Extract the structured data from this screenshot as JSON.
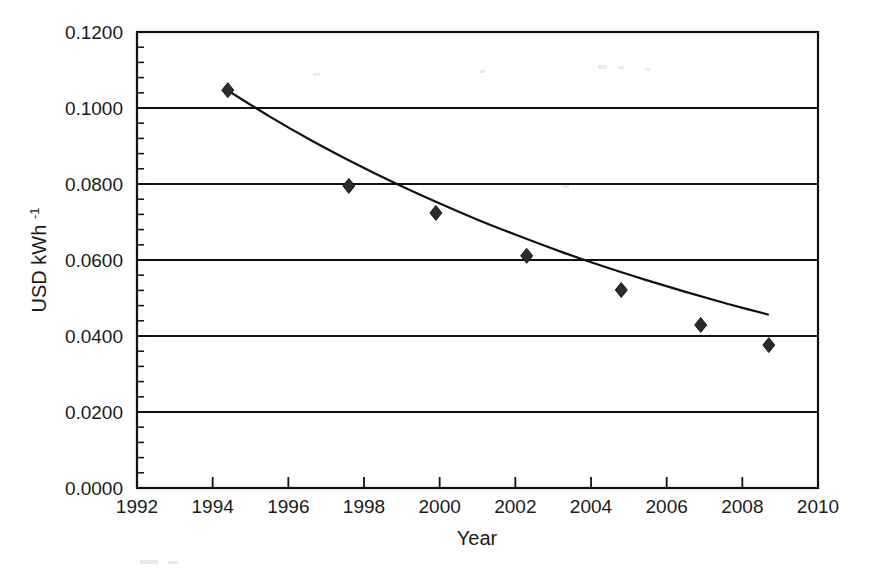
{
  "chart_data": {
    "type": "scatter",
    "title": "",
    "subtitle": "",
    "xlabel": "Year",
    "ylabel": "USD kWh",
    "ylabel_superscript": "-1",
    "ylabel_full": "USD kWh⁻¹",
    "xlim": [
      1992,
      2010
    ],
    "ylim": [
      0.0,
      0.12
    ],
    "grid": "horizontal-major-only",
    "legend": "none",
    "x_ticks": [
      1992,
      1994,
      1996,
      1998,
      2000,
      2002,
      2004,
      2006,
      2008,
      2010
    ],
    "x_tick_labels": [
      "1992",
      "1994",
      "1996",
      "1998",
      "2000",
      "2002",
      "2004",
      "2006",
      "2008",
      "2010"
    ],
    "x_tick_step": 2,
    "y_ticks": [
      0.0,
      0.02,
      0.04,
      0.06,
      0.08,
      0.1,
      0.12
    ],
    "y_tick_labels": [
      "0.0000",
      "0.0200",
      "0.0400",
      "0.0600",
      "0.0800",
      "0.1000",
      "0.1200"
    ],
    "y_minor_tick_step": 0.004,
    "marker_shape": "diamond",
    "marker_color": "#2b2b2b",
    "line_color": "#111111",
    "series": [
      {
        "name": "Price",
        "x": [
          1994.4,
          1997.6,
          1999.9,
          2002.3,
          2004.8,
          2006.9,
          2008.7
        ],
        "values": [
          0.1047,
          0.0795,
          0.0724,
          0.0611,
          0.0521,
          0.0429,
          0.0376
        ]
      }
    ],
    "trend": {
      "type": "fitted-curve",
      "x": [
        1994.4,
        1995.5,
        1996.6,
        1997.7,
        1998.8,
        1999.9,
        2001.0,
        2002.1,
        2003.2,
        2004.3,
        2005.4,
        2006.5,
        2007.6,
        2008.7
      ],
      "values": [
        0.1046,
        0.0978,
        0.0915,
        0.0857,
        0.0803,
        0.0753,
        0.0706,
        0.0663,
        0.0622,
        0.0584,
        0.0549,
        0.0516,
        0.0485,
        0.0456
      ]
    }
  },
  "colors": {
    "background": "#ffffff",
    "foreground": "#111111",
    "marker": "#2b2b2b"
  }
}
